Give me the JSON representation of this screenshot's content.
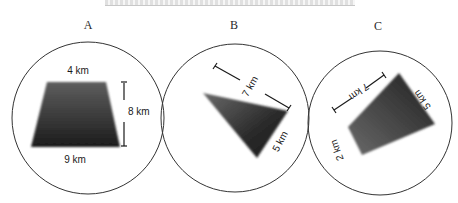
{
  "header": {
    "truncated_title": ""
  },
  "panels": [
    {
      "id": "A",
      "label": "A",
      "shape": "trapezoid",
      "dimensions": {
        "top": "4 km",
        "bottom": "9 km",
        "height": "8 km"
      }
    },
    {
      "id": "B",
      "label": "B",
      "shape": "triangle",
      "dimensions": {
        "side_long": "7 km",
        "side_short": "5 km"
      }
    },
    {
      "id": "C",
      "label": "C",
      "shape": "quadrilateral",
      "dimensions": {
        "side_long": "7 km",
        "side_right": "5 km",
        "side_left": "2 km"
      }
    }
  ],
  "colors": {
    "shape_fill_dark": "#1e1e1e",
    "shape_fill_light": "#6a6a6a",
    "circle_stroke": "#333333",
    "background": "#ffffff"
  }
}
